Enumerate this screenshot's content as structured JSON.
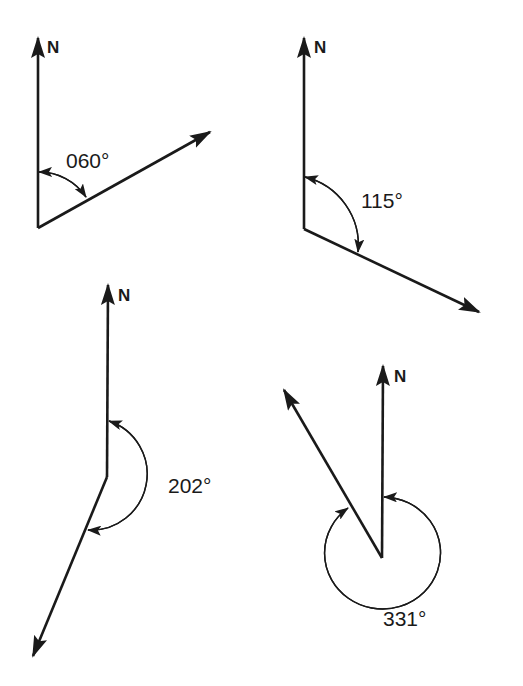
{
  "figure": {
    "colors": {
      "ink": "#1a1a1a",
      "background": "#ffffff"
    },
    "diagrams": [
      {
        "id": "bearing-060",
        "north_label": "N",
        "angle_label": "060°",
        "bearing_degrees": 60,
        "vertex": [
          38,
          228
        ],
        "north_tip": [
          38,
          36
        ],
        "direction_tip": [
          210,
          132
        ],
        "arc": {
          "start": [
            38,
            172
          ],
          "end": [
            86,
            198
          ],
          "radius": 56
        }
      },
      {
        "id": "bearing-115",
        "north_label": "N",
        "angle_label": "115°",
        "bearing_degrees": 115,
        "vertex": [
          304,
          229
        ],
        "north_tip": [
          304,
          36
        ],
        "direction_tip": [
          479,
          312
        ],
        "arc": {
          "start": [
            304,
            177
          ],
          "end": [
            358,
            253
          ],
          "radius": 57
        }
      },
      {
        "id": "bearing-202",
        "north_label": "N",
        "angle_label": "202°",
        "bearing_degrees": 202,
        "vertex": [
          107,
          477
        ],
        "north_tip": [
          108,
          283
        ],
        "direction_tip": [
          33,
          656
        ],
        "arc": {
          "start": [
            108,
            421
          ],
          "end": [
            88,
            530
          ],
          "radius": 56
        }
      },
      {
        "id": "bearing-331",
        "north_label": "N",
        "angle_label": "331°",
        "bearing_degrees": 331,
        "vertex": [
          382,
          558
        ],
        "north_tip": [
          383,
          364
        ],
        "direction_tip": [
          284,
          390
        ],
        "arc": {
          "start": [
            384,
            497
          ],
          "end": [
            348,
            508
          ],
          "radius": 58
        }
      }
    ]
  }
}
